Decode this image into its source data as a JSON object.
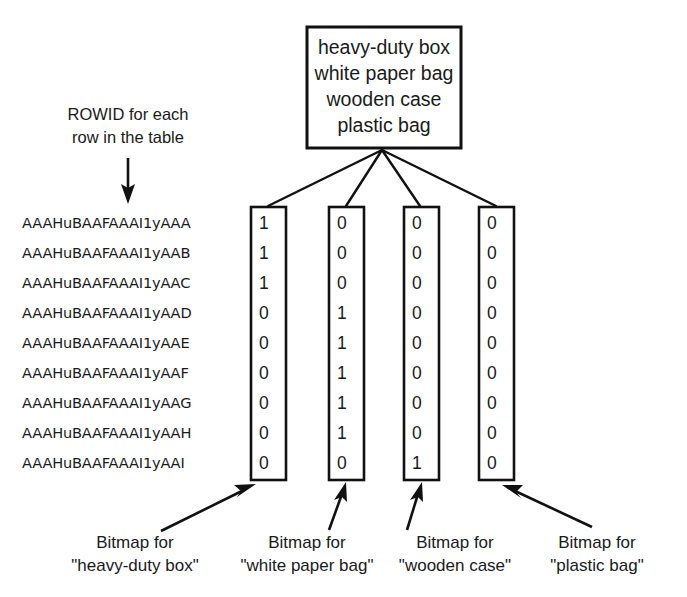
{
  "diagram": {
    "title_box": {
      "name": "column-values-box",
      "lines": [
        "heavy-duty box",
        "white paper bag",
        "wooden case",
        "plastic bag"
      ]
    },
    "rowid_note": {
      "line1": "ROWID for each",
      "line2": "row in the table"
    },
    "rowids": [
      "AAAHuBAAFAAAI1yAAA",
      "AAAHuBAAFAAAI1yAAB",
      "AAAHuBAAFAAAI1yAAC",
      "AAAHuBAAFAAAI1yAAD",
      "AAAHuBAAFAAAI1yAAE",
      "AAAHuBAAFAAAI1yAAF",
      "AAAHuBAAFAAAI1yAAG",
      "AAAHuBAAFAAAI1yAAH",
      "AAAHuBAAFAAAI1yAAI"
    ],
    "bitmaps": [
      {
        "value": "heavy-duty box",
        "caption_line1": "Bitmap for",
        "caption_line2": "\"heavy-duty box\"",
        "bits": [
          "1",
          "1",
          "1",
          "0",
          "0",
          "0",
          "0",
          "0",
          "0"
        ]
      },
      {
        "value": "white paper bag",
        "caption_line1": "Bitmap for",
        "caption_line2": "\"white paper bag\"",
        "bits": [
          "0",
          "0",
          "0",
          "1",
          "1",
          "1",
          "1",
          "1",
          "0"
        ]
      },
      {
        "value": "wooden case",
        "caption_line1": "Bitmap for",
        "caption_line2": "\"wooden case\"",
        "bits": [
          "0",
          "0",
          "0",
          "0",
          "0",
          "0",
          "0",
          "0",
          "1"
        ]
      },
      {
        "value": "plastic bag",
        "caption_line1": "Bitmap for",
        "caption_line2": "\"plastic bag\"",
        "bits": [
          "0",
          "0",
          "0",
          "0",
          "0",
          "0",
          "0",
          "0",
          "0"
        ]
      }
    ],
    "colors": {
      "ink": "#111111",
      "paper": "#ffffff",
      "text": "#1a1a1a"
    }
  }
}
